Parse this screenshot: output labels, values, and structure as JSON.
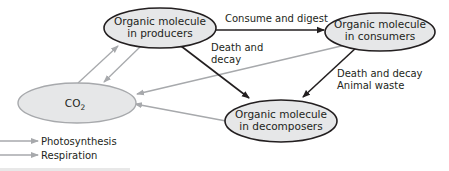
{
  "diagram": {
    "type": "carbon-cycle",
    "nodes": {
      "producers": {
        "line1": "Organic molecule",
        "line2": "in producers"
      },
      "consumers": {
        "line1": "Organic molecule",
        "line2": "in consumers"
      },
      "decomposers": {
        "line1": "Organic molecule",
        "line2": "in decomposers"
      },
      "co2": {
        "label": "CO",
        "subscript": "2"
      }
    },
    "edge_labels": {
      "consume_digest": "Consume and digest",
      "death_decay_1_line1": "Death and",
      "death_decay_1_line2": "decay",
      "death_decay_2_line1": "Death and decay",
      "death_decay_2_line2": "Animal waste"
    },
    "legend": {
      "photosynthesis": "Photosynthesis",
      "respiration": "Respiration"
    },
    "colors": {
      "node_fill": "#e6e7e8",
      "node_stroke": "#231f20",
      "co2_stroke": "#a7a9ac",
      "black_arrow": "#231f20",
      "gray_arrow": "#a7a9ac"
    }
  }
}
